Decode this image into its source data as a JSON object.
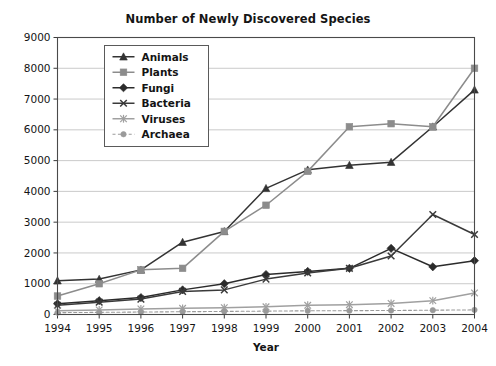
{
  "chart_data": {
    "type": "line",
    "title": "Number of Newly Discovered Species",
    "xlabel": "Year",
    "ylabel": "",
    "categories": [
      "1994",
      "1995",
      "1996",
      "1997",
      "1998",
      "1999",
      "2000",
      "2001",
      "2002",
      "2003",
      "2004"
    ],
    "x": [
      1994,
      1995,
      1996,
      1997,
      1998,
      1999,
      2000,
      2001,
      2002,
      2003,
      2004
    ],
    "xlim": [
      1994,
      2004
    ],
    "ylim": [
      0,
      9000
    ],
    "ytick_labels": [
      "0",
      "1000",
      "2000",
      "3000",
      "4000",
      "5000",
      "6000",
      "7000",
      "8000",
      "9000"
    ],
    "ytick_values": [
      0,
      1000,
      2000,
      3000,
      4000,
      5000,
      6000,
      7000,
      8000,
      9000
    ],
    "grid": true,
    "legend_position": "upper left",
    "series": [
      {
        "name": "Animals",
        "marker": "triangle",
        "color": "#333333",
        "dashed": false,
        "values": [
          1100,
          1150,
          1450,
          2350,
          2700,
          4100,
          4700,
          4850,
          4950,
          6100,
          7300
        ]
      },
      {
        "name": "Plants",
        "marker": "square",
        "color": "#8c8c8c",
        "dashed": false,
        "values": [
          600,
          1000,
          1450,
          1500,
          2700,
          3550,
          4650,
          6100,
          6200,
          6100,
          8000
        ]
      },
      {
        "name": "Fungi",
        "marker": "diamond",
        "color": "#2b2b2b",
        "dashed": false,
        "values": [
          350,
          450,
          550,
          800,
          1000,
          1300,
          1400,
          1500,
          2150,
          1550,
          1750
        ]
      },
      {
        "name": "Bacteria",
        "marker": "x",
        "color": "#3a3a3a",
        "dashed": false,
        "values": [
          300,
          400,
          500,
          750,
          800,
          1150,
          1350,
          1500,
          1900,
          3250,
          2600
        ]
      },
      {
        "name": "Viruses",
        "marker": "asterisk",
        "color": "#a0a0a0",
        "dashed": false,
        "values": [
          120,
          150,
          180,
          200,
          220,
          250,
          300,
          320,
          360,
          450,
          700
        ]
      },
      {
        "name": "Archaea",
        "marker": "circle",
        "color": "#9a9a9a",
        "dashed": true,
        "values": [
          60,
          70,
          80,
          90,
          100,
          110,
          120,
          125,
          130,
          140,
          150
        ]
      }
    ]
  },
  "legend": {
    "items": [
      {
        "label": "Animals"
      },
      {
        "label": "Plants"
      },
      {
        "label": "Fungi"
      },
      {
        "label": "Bacteria"
      },
      {
        "label": "Viruses"
      },
      {
        "label": "Archaea"
      }
    ]
  }
}
